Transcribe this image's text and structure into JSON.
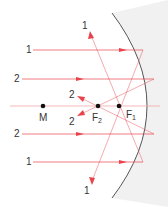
{
  "diagram": {
    "type": "concave-mirror-ray-diagram",
    "colors": {
      "ray": "#e8434b",
      "ray_light": "#f2a7ab",
      "mirror": "#555555",
      "point": "#111111",
      "text": "#333333"
    },
    "points": [
      {
        "id": "M",
        "label": "M",
        "x": 43,
        "y": 106
      },
      {
        "id": "F2",
        "label": "F",
        "sub": "2",
        "x": 98,
        "y": 106
      },
      {
        "id": "F1",
        "label": "F",
        "sub": "1",
        "x": 119,
        "y": 106
      }
    ],
    "ray_labels": {
      "incoming_top_1": "1",
      "incoming_top_2": "2",
      "incoming_bottom_2": "2",
      "incoming_bottom_1": "1",
      "reflected_up_1": "1",
      "reflected_down_1": "1",
      "reflected_up_2": "2",
      "reflected_down_2": "2"
    }
  }
}
